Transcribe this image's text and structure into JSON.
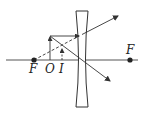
{
  "diagram": {
    "type": "ray-diagram",
    "colors": {
      "stroke": "#333333",
      "background": "#ffffff"
    },
    "labels": {
      "focus_left": "F",
      "object": "O",
      "image": "I",
      "focus_right": "F"
    },
    "elements": {
      "optical_axis": {
        "x1": 6,
        "y1": 60,
        "x2": 138,
        "y2": 60
      },
      "lens": {
        "type": "concave",
        "top": 11,
        "bottom": 107,
        "outer_left": 76,
        "outer_right": 88,
        "waist_left": 79.5,
        "waist_right": 84.5
      },
      "focus_left_point": {
        "x": 34,
        "y": 60
      },
      "focus_right_point": {
        "x": 130,
        "y": 60
      },
      "object_arrow": {
        "x": 50,
        "base_y": 60,
        "tip_y": 36
      },
      "image_arrow": {
        "x": 62,
        "base_y": 60,
        "tip_y": 49
      },
      "ray_parallel": {
        "from": [
          50,
          36
        ],
        "to_lens": [
          79,
          36
        ],
        "refracted_to": [
          118,
          16
        ]
      },
      "ray_virtual_extension": {
        "from": [
          34,
          60
        ],
        "to": [
          79,
          36
        ],
        "dashed": true
      },
      "ray_center": {
        "from": [
          50,
          36
        ],
        "to": [
          110,
          81
        ]
      }
    }
  }
}
